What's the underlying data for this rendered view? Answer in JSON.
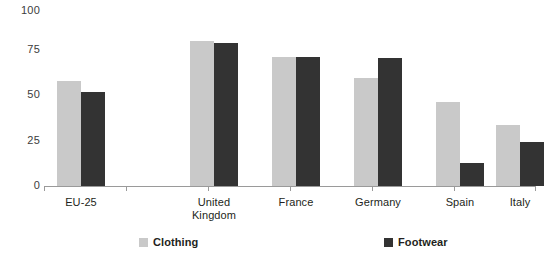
{
  "chart_data": {
    "type": "bar",
    "title": "",
    "xlabel": "",
    "ylabel": "",
    "ylim": [
      0,
      100
    ],
    "yticks": [
      0,
      25,
      50,
      75,
      100
    ],
    "grid": false,
    "legend_position": "bottom",
    "categories": [
      "EU-25",
      "United Kingdom",
      "France",
      "Germany",
      "Spain",
      "Italy"
    ],
    "series": [
      {
        "name": "Clothing",
        "color": "#c9c9c9",
        "values": [
          60,
          83,
          74,
          62,
          48,
          35
        ]
      },
      {
        "name": "Footwear",
        "color": "#333333",
        "values": [
          54,
          82,
          74,
          73,
          13,
          25
        ]
      }
    ]
  },
  "axis": {
    "tick_labels": [
      "100",
      "75",
      "50",
      "25",
      "0"
    ]
  },
  "categories": [
    {
      "line1": "EU-25",
      "line2": ""
    },
    {
      "line1": "United",
      "line2": "Kingdom"
    },
    {
      "line1": "France",
      "line2": ""
    },
    {
      "line1": "Germany",
      "line2": ""
    },
    {
      "line1": "Spain",
      "line2": ""
    },
    {
      "line1": "Italy",
      "line2": ""
    }
  ],
  "legend": {
    "items": [
      {
        "label": "Clothing",
        "color": "#c9c9c9"
      },
      {
        "label": "Footwear",
        "color": "#333333"
      }
    ]
  }
}
